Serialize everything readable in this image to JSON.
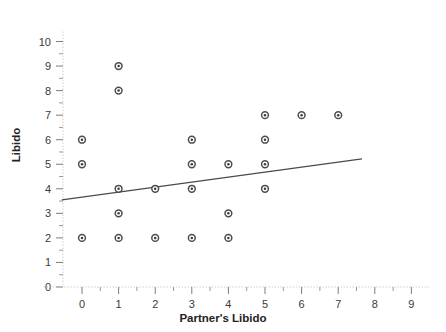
{
  "chart_data": {
    "type": "scatter",
    "title": "",
    "xlabel": "Partner's Libido",
    "ylabel": "Libido",
    "xlim": [
      -0.5,
      9.5
    ],
    "ylim": [
      0,
      10.4
    ],
    "xticks": [
      0,
      1,
      2,
      3,
      4,
      5,
      6,
      7,
      8,
      9
    ],
    "xtick_labels": [
      "0",
      "1",
      "2",
      "3",
      "4",
      "5",
      "6",
      "7",
      "8",
      "9"
    ],
    "yticks": [
      0,
      1,
      2,
      3,
      4,
      5,
      6,
      7,
      8,
      9,
      10
    ],
    "ytick_labels": [
      "0",
      "1",
      "2",
      "3",
      "4",
      "5",
      "6",
      "7",
      "8",
      "9",
      "10"
    ],
    "grid": false,
    "legend": null,
    "marker": "circle-open-dot",
    "marker_color": "#3d3d3d",
    "points": [
      {
        "x": 0,
        "y": 6
      },
      {
        "x": 0,
        "y": 5
      },
      {
        "x": 0,
        "y": 2
      },
      {
        "x": 1,
        "y": 9
      },
      {
        "x": 1,
        "y": 8
      },
      {
        "x": 1,
        "y": 4
      },
      {
        "x": 1,
        "y": 3
      },
      {
        "x": 1,
        "y": 2
      },
      {
        "x": 2,
        "y": 4
      },
      {
        "x": 2,
        "y": 2
      },
      {
        "x": 3,
        "y": 6
      },
      {
        "x": 3,
        "y": 5
      },
      {
        "x": 3,
        "y": 4
      },
      {
        "x": 3,
        "y": 2
      },
      {
        "x": 4,
        "y": 5
      },
      {
        "x": 4,
        "y": 3
      },
      {
        "x": 4,
        "y": 2
      },
      {
        "x": 5,
        "y": 7
      },
      {
        "x": 5,
        "y": 6
      },
      {
        "x": 5,
        "y": 5
      },
      {
        "x": 5,
        "y": 4
      },
      {
        "x": 6,
        "y": 7
      },
      {
        "x": 7,
        "y": 7
      }
    ],
    "fit_line": {
      "label": "",
      "color": "#4a4a4a",
      "x_start": -0.55,
      "y_start": 3.55,
      "x_end": 7.65,
      "y_end": 5.22
    }
  }
}
